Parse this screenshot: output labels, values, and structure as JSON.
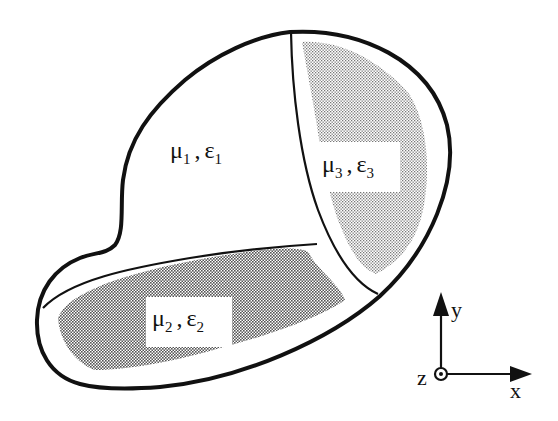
{
  "diagram": {
    "type": "inhomogeneous-media-regions",
    "regions": [
      {
        "id": "region-1",
        "mu": "μ",
        "eps": "ε",
        "sub": "1",
        "fill": "none"
      },
      {
        "id": "region-2",
        "mu": "μ",
        "eps": "ε",
        "sub": "2",
        "fill": "dark-stipple"
      },
      {
        "id": "region-3",
        "mu": "μ",
        "eps": "ε",
        "sub": "3",
        "fill": "light-stipple"
      }
    ],
    "separator": ",",
    "axes": {
      "x": "x",
      "y": "y",
      "z": "z"
    },
    "colors": {
      "outline": "#111111",
      "stipple_dark": "#8a8a8a",
      "stipple_light": "#b9b9b9",
      "background": "#ffffff"
    }
  }
}
